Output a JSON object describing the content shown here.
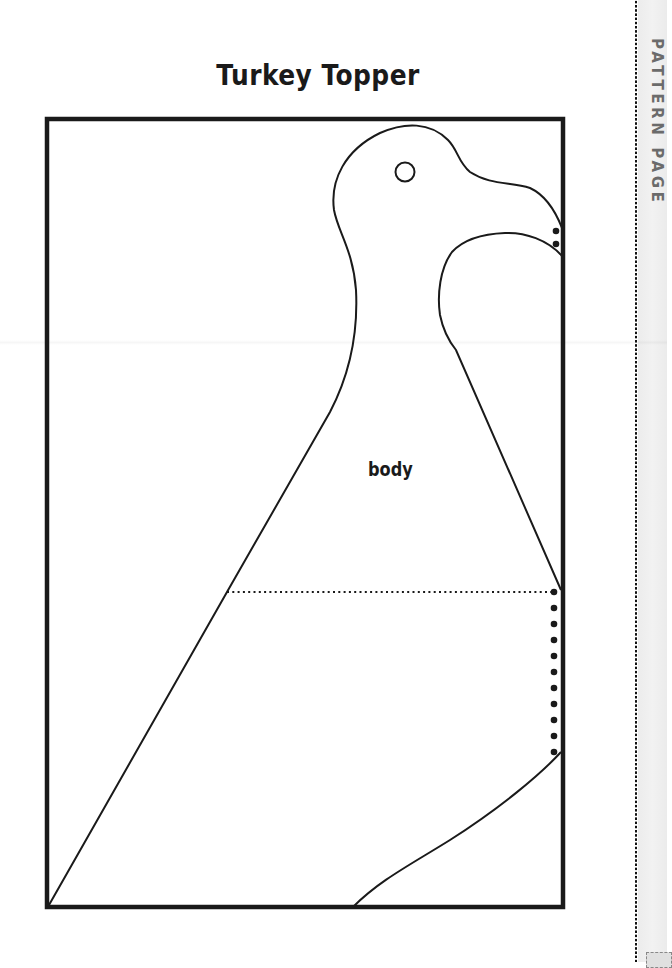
{
  "page": {
    "title": "Turkey Topper",
    "side_label": "PATTERN PAGE"
  },
  "pattern": {
    "piece_label": "body",
    "frame_color": "#1a1a1a",
    "band_color": "#efefef",
    "side_label_color": "#6b6b6b",
    "fold_dots_count": 11,
    "beak_dots_count": 2
  }
}
